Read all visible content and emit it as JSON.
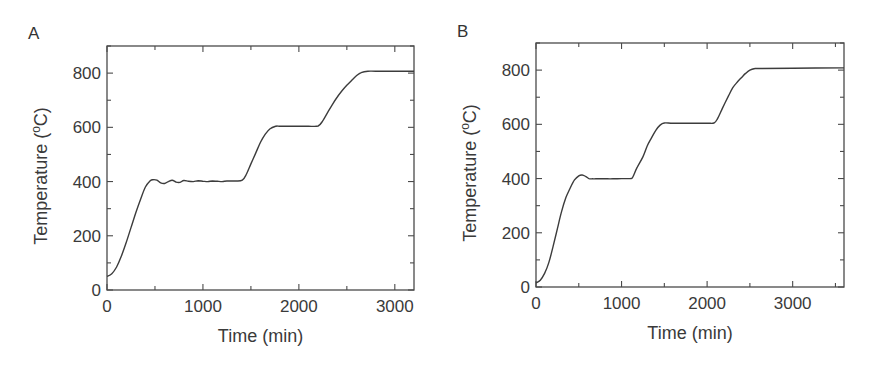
{
  "figure": {
    "panels": [
      {
        "label": "A"
      },
      {
        "label": "B"
      }
    ]
  },
  "chart_data": [
    {
      "panel": "A",
      "type": "line",
      "title": "",
      "xlabel": "Time (min)",
      "ylabel": "Temperature (°C)",
      "xlim": [
        0,
        3200
      ],
      "ylim": [
        0,
        900
      ],
      "xticks": [
        0,
        1000,
        2000,
        3000
      ],
      "yticks": [
        0,
        200,
        400,
        600,
        800
      ],
      "grid": false,
      "legend": null,
      "series": [
        {
          "name": "Temperature",
          "x": [
            0,
            50,
            100,
            150,
            200,
            250,
            300,
            350,
            400,
            450,
            480,
            520,
            560,
            600,
            640,
            680,
            720,
            760,
            800,
            850,
            900,
            950,
            1000,
            1050,
            1100,
            1150,
            1200,
            1250,
            1300,
            1350,
            1410,
            1450,
            1500,
            1550,
            1600,
            1650,
            1700,
            1760,
            1800,
            1900,
            2000,
            2100,
            2200,
            2250,
            2300,
            2350,
            2400,
            2450,
            2500,
            2550,
            2600,
            2650,
            2720,
            2800,
            3000,
            3200
          ],
          "y": [
            50,
            60,
            85,
            125,
            175,
            230,
            285,
            335,
            380,
            403,
            407,
            405,
            395,
            393,
            400,
            405,
            398,
            397,
            404,
            401,
            400,
            403,
            401,
            400,
            402,
            401,
            400,
            402,
            402,
            402,
            405,
            425,
            465,
            505,
            545,
            575,
            595,
            604,
            604,
            604,
            604,
            604,
            605,
            625,
            655,
            685,
            712,
            735,
            755,
            773,
            790,
            802,
            807,
            807,
            807,
            807
          ]
        }
      ]
    },
    {
      "panel": "B",
      "type": "line",
      "title": "",
      "xlabel": "Time (min)",
      "ylabel": "Temperature (°C)",
      "xlim": [
        0,
        3600
      ],
      "ylim": [
        0,
        900
      ],
      "xticks": [
        0,
        1000,
        2000,
        3000
      ],
      "yticks": [
        0,
        200,
        400,
        600,
        800
      ],
      "grid": false,
      "legend": null,
      "series": [
        {
          "name": "Temperature",
          "x": [
            0,
            50,
            100,
            150,
            200,
            250,
            300,
            350,
            400,
            450,
            500,
            540,
            580,
            620,
            660,
            700,
            800,
            900,
            1000,
            1100,
            1130,
            1180,
            1250,
            1300,
            1350,
            1400,
            1450,
            1500,
            1600,
            1800,
            2000,
            2080,
            2120,
            2180,
            2250,
            2300,
            2350,
            2400,
            2450,
            2500,
            2560,
            2600,
            3000,
            3600
          ],
          "y": [
            15,
            25,
            50,
            90,
            150,
            215,
            280,
            330,
            365,
            395,
            410,
            413,
            408,
            400,
            399,
            399,
            399,
            399,
            400,
            400,
            405,
            440,
            480,
            520,
            550,
            578,
            597,
            605,
            604,
            604,
            604,
            605,
            620,
            660,
            705,
            735,
            755,
            772,
            788,
            800,
            806,
            806,
            807,
            808
          ]
        }
      ]
    }
  ]
}
